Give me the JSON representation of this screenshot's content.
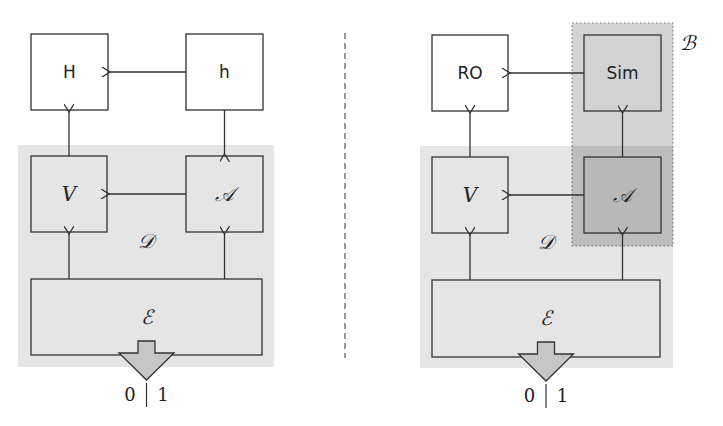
{
  "colors": {
    "background": "#ffffff",
    "stroke": "#333333",
    "region_D": "#e5e5e5",
    "region_B": "#d3d3d3",
    "region_overlap": "#bdbdbd",
    "box_white": "#ffffff",
    "output_arrow": "#c6c6c6",
    "divider": "#555555"
  },
  "left_diagram": {
    "boxes": {
      "H": "H",
      "h": "h",
      "V": "V",
      "A": "𝒜",
      "E": "ℰ"
    },
    "region_label": "𝒟",
    "output": {
      "zero": "0",
      "sep": "|",
      "one": "1"
    }
  },
  "right_diagram": {
    "boxes": {
      "RO": "RO",
      "Sim": "Sim",
      "V": "V",
      "A": "𝒜",
      "E": "ℰ"
    },
    "region_label": "𝒟",
    "bound_label": "ℬ",
    "output": {
      "zero": "0",
      "sep": "|",
      "one": "1"
    }
  }
}
